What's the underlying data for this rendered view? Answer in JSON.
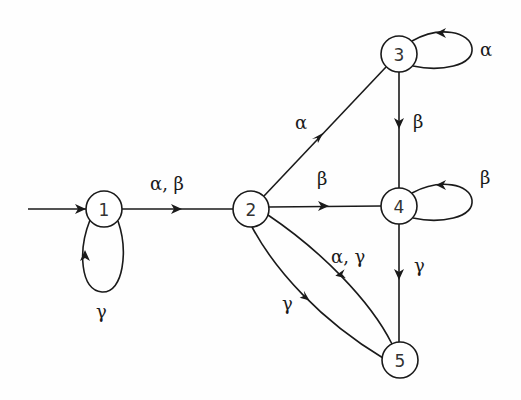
{
  "diagram": {
    "type": "state-transition-diagram",
    "initial_state": "1",
    "nodes": [
      {
        "id": "1",
        "label": "1",
        "x": 104,
        "y": 209
      },
      {
        "id": "2",
        "label": "2",
        "x": 251,
        "y": 209
      },
      {
        "id": "3",
        "label": "3",
        "x": 399,
        "y": 54
      },
      {
        "id": "4",
        "label": "4",
        "x": 399,
        "y": 206
      },
      {
        "id": "5",
        "label": "5",
        "x": 400,
        "y": 360
      }
    ],
    "edges": [
      {
        "from": "start",
        "to": "1",
        "label": ""
      },
      {
        "from": "1",
        "to": "1",
        "label": "γ"
      },
      {
        "from": "1",
        "to": "2",
        "label": "α, β"
      },
      {
        "from": "2",
        "to": "3",
        "label": "α"
      },
      {
        "from": "2",
        "to": "4",
        "label": "β"
      },
      {
        "from": "2",
        "to": "5",
        "label": "γ"
      },
      {
        "from": "3",
        "to": "3",
        "label": "α"
      },
      {
        "from": "3",
        "to": "4",
        "label": "β"
      },
      {
        "from": "4",
        "to": "4",
        "label": "β"
      },
      {
        "from": "4",
        "to": "5",
        "label": "γ"
      },
      {
        "from": "5",
        "to": "2",
        "label": "α, γ"
      }
    ]
  },
  "labels": {
    "n1": "1",
    "n2": "2",
    "n3": "3",
    "n4": "4",
    "n5": "5",
    "e_1_1": "γ",
    "e_1_2": "α, β",
    "e_2_3": "α",
    "e_2_4": "β",
    "e_2_5": "γ",
    "e_3_3": "α",
    "e_3_4": "β",
    "e_4_4": "β",
    "e_4_5": "γ",
    "e_5_2": "α, γ"
  }
}
